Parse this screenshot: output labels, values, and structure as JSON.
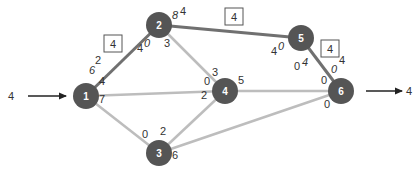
{
  "colors": {
    "node": "#555555",
    "node_text": "#ffffff",
    "path_edge": "#707070",
    "other_edge": "#bdbdbd",
    "arrow": "#222222",
    "label": "#333333"
  },
  "source_flow": "4",
  "sink_flow": "4",
  "nodes": [
    {
      "id": "1",
      "x": 86,
      "y": 96
    },
    {
      "id": "2",
      "x": 159,
      "y": 25
    },
    {
      "id": "3",
      "x": 159,
      "y": 153
    },
    {
      "id": "4",
      "x": 225,
      "y": 91
    },
    {
      "id": "5",
      "x": 301,
      "y": 38
    },
    {
      "id": "6",
      "x": 341,
      "y": 91
    }
  ],
  "edges": [
    {
      "from": "1",
      "to": "2",
      "highlight": true
    },
    {
      "from": "2",
      "to": "5",
      "highlight": true
    },
    {
      "from": "5",
      "to": "6",
      "highlight": true
    },
    {
      "from": "2",
      "to": "4",
      "highlight": false
    },
    {
      "from": "1",
      "to": "4",
      "highlight": false
    },
    {
      "from": "1",
      "to": "3",
      "highlight": false
    },
    {
      "from": "3",
      "to": "4",
      "highlight": false
    },
    {
      "from": "4",
      "to": "6",
      "highlight": false
    },
    {
      "from": "3",
      "to": "6",
      "highlight": false
    }
  ],
  "path_flow_boxes": [
    {
      "label": "4",
      "x": 113,
      "y": 44
    },
    {
      "label": "4",
      "x": 234,
      "y": 17
    },
    {
      "label": "4",
      "x": 330,
      "y": 49
    }
  ],
  "capacity_labels": [
    {
      "text": "2",
      "x": 98,
      "y": 64,
      "italic": false
    },
    {
      "text": "6",
      "x": 92,
      "y": 74,
      "italic": true
    },
    {
      "text": "4",
      "x": 140,
      "y": 52,
      "italic": false
    },
    {
      "text": "0",
      "x": 147,
      "y": 47,
      "italic": true
    },
    {
      "text": "8",
      "x": 175,
      "y": 19,
      "italic": true
    },
    {
      "text": "4",
      "x": 183,
      "y": 15,
      "italic": false
    },
    {
      "text": "3",
      "x": 167,
      "y": 47,
      "italic": false
    },
    {
      "text": "4",
      "x": 274,
      "y": 55,
      "italic": false
    },
    {
      "text": "0",
      "x": 281,
      "y": 50,
      "italic": true
    },
    {
      "text": "0",
      "x": 297,
      "y": 70,
      "italic": false
    },
    {
      "text": "4",
      "x": 305,
      "y": 66,
      "italic": true
    },
    {
      "text": "4",
      "x": 342,
      "y": 64,
      "italic": false
    },
    {
      "text": "0",
      "x": 334,
      "y": 73,
      "italic": true
    },
    {
      "text": "4",
      "x": 102,
      "y": 85,
      "italic": false
    },
    {
      "text": "7",
      "x": 102,
      "y": 103,
      "italic": false
    },
    {
      "text": "0",
      "x": 207,
      "y": 85,
      "italic": false
    },
    {
      "text": "3",
      "x": 215,
      "y": 76,
      "italic": false
    },
    {
      "text": "2",
      "x": 204,
      "y": 99,
      "italic": false
    },
    {
      "text": "5",
      "x": 241,
      "y": 84,
      "italic": false
    },
    {
      "text": "0",
      "x": 324,
      "y": 84,
      "italic": false
    },
    {
      "text": "0",
      "x": 327,
      "y": 108,
      "italic": false
    },
    {
      "text": "0",
      "x": 145,
      "y": 138,
      "italic": false
    },
    {
      "text": "2",
      "x": 163,
      "y": 135,
      "italic": false
    },
    {
      "text": "6",
      "x": 175,
      "y": 159,
      "italic": false
    }
  ]
}
